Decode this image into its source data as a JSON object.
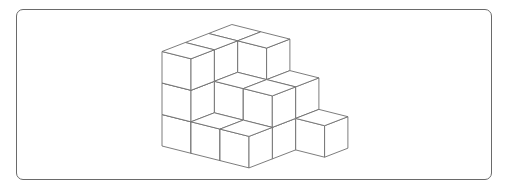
{
  "figure": {
    "type": "isometric-cube-stack",
    "cube_count": 21,
    "grid_size": {
      "x": 4,
      "y": 3
    },
    "heights_by_column_x": [
      [
        3,
        3,
        3
      ],
      [
        1,
        2,
        3
      ],
      [
        1,
        2,
        2
      ],
      [
        0,
        0,
        1
      ]
    ],
    "projection": {
      "origin": [
        162,
        146
      ],
      "x_vector": [
        29,
        7.3
      ],
      "y_vector": [
        23.3,
        -9
      ],
      "z_vector": [
        0,
        -31.5
      ]
    },
    "colors": {
      "background": "#ffffff",
      "face_fill": "#ffffff",
      "edge_stroke": "#6e6e6e",
      "frame_border": "#6a6a6a"
    }
  }
}
